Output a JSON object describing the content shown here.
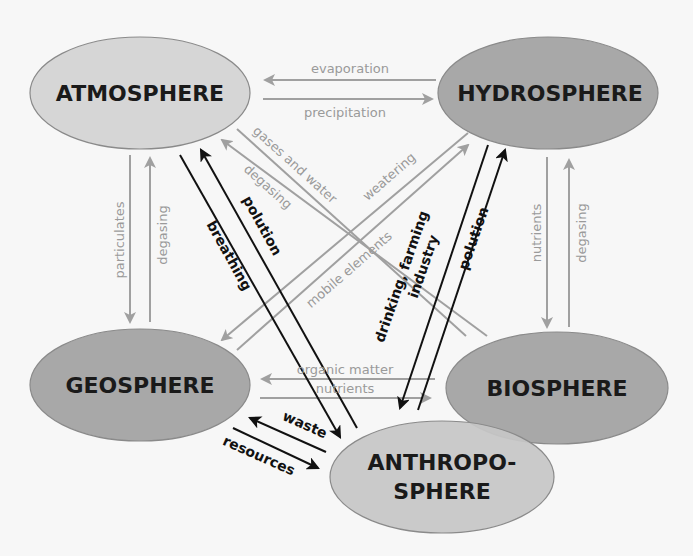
{
  "diagram": {
    "colors": {
      "background": "#f7f7f7",
      "light_sphere": "#d6d6d6",
      "dark_sphere": "#a8a8a8",
      "anthropo_sphere": "#c6c6c6",
      "sphere_stroke": "#8a8a8a",
      "gray_arrow": "#a0a0a0",
      "black_arrow": "#111111"
    },
    "spheres": {
      "atmosphere": "ATMOSPHERE",
      "hydrosphere": "HYDROSPHERE",
      "geosphere": "GEOSPHERE",
      "biosphere": "BIOSPHERE",
      "anthroposphere_line1": "ANTHROPO-",
      "anthroposphere_line2": "SPHERE"
    },
    "flows": {
      "evaporation": "evaporation",
      "precipitation": "precipitation",
      "particulates": "particulates",
      "degasing_geo_atmo": "degasing",
      "nutrients_hydro_bio": "nutrients",
      "degasing_bio_hydro": "degasing",
      "gases_and_water": "gases and water",
      "degasing_bio_atmo": "degasing",
      "weatering": "weatering",
      "mobile_elements": "mobile elements",
      "breathing": "breathing",
      "polution_anthro_atmo": "polution",
      "drinking_farming": "drinking, farming",
      "industry": "industry",
      "polution_anthro_hydro": "polution",
      "organic_matter": "organic matter",
      "nutrients_geo_bio": "nutrients",
      "waste": "waste",
      "resources": "resources"
    }
  }
}
